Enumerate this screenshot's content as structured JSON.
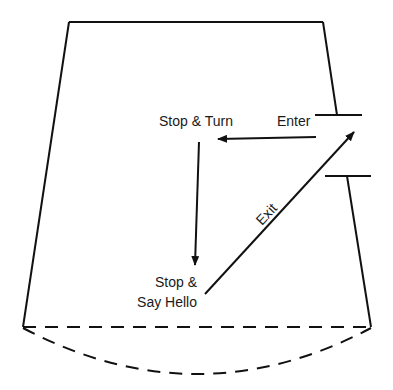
{
  "diagram": {
    "type": "room-floor-plan-flow",
    "labels": {
      "enter": "Enter",
      "stop_turn": "Stop & Turn",
      "stop_hello_line1": "Stop &",
      "stop_hello_line2": "Say Hello",
      "exit": "Exit"
    },
    "colors": {
      "line": "#111111",
      "background": "#ffffff"
    },
    "flow": [
      {
        "from": "Enter",
        "to": "Stop & Turn",
        "direction": "left"
      },
      {
        "from": "Stop & Turn",
        "to": "Stop & Say Hello",
        "direction": "down"
      },
      {
        "from": "Stop & Say Hello",
        "to": "Exit door",
        "direction": "up-right",
        "label": "Exit"
      }
    ]
  }
}
